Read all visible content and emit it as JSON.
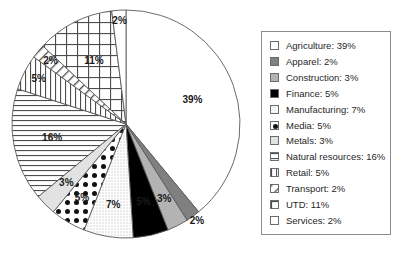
{
  "chart_data": {
    "type": "pie",
    "title": "",
    "subtitle": "",
    "xlabel": "",
    "ylabel": "",
    "grid": false,
    "legend_position": "right",
    "start_angle_deg": 0,
    "direction": "clockwise",
    "units": "percent",
    "categories": [
      "Agriculture",
      "Apparel",
      "Construction",
      "Finance",
      "Manufacturing",
      "Media",
      "Metals",
      "Natural resources",
      "Retail",
      "Transport",
      "UTD",
      "Services"
    ],
    "values": [
      39,
      2,
      3,
      5,
      7,
      5,
      3,
      16,
      5,
      2,
      11,
      2
    ],
    "slice_labels": [
      "39%",
      "2%",
      "3%",
      "5%",
      "7%",
      "5%",
      "3%",
      "16%",
      "5%",
      "2%",
      "11%",
      "2%"
    ],
    "fills": [
      "white",
      "dark-gray",
      "medium-gray",
      "black",
      "fine-dots",
      "polka-dots",
      "light-gray",
      "horizontal-lines",
      "vertical-lines",
      "diagonal-lines",
      "grid-crosshatch",
      "white"
    ],
    "colors": {
      "white": "#ffffff",
      "dark-gray": "#808080",
      "medium-gray": "#b3b3b3",
      "black": "#000000",
      "light-gray": "#e2e2e2",
      "outline": "#595959",
      "label_text": "#1a1a1a"
    }
  },
  "legend": {
    "items": [
      {
        "label": "Agriculture: 39%",
        "swatch": "white",
        "name": "legend-swatch-agriculture"
      },
      {
        "label": "Apparel: 2%",
        "swatch": "dark-gray",
        "name": "legend-swatch-apparel"
      },
      {
        "label": "Construction: 3%",
        "swatch": "medium-gray",
        "name": "legend-swatch-construction"
      },
      {
        "label": "Finance: 5%",
        "swatch": "black",
        "name": "legend-swatch-finance"
      },
      {
        "label": "Manufacturing: 7%",
        "swatch": "fine-dots",
        "name": "legend-swatch-manufacturing"
      },
      {
        "label": "Media: 5%",
        "swatch": "polka-dots",
        "name": "legend-swatch-media"
      },
      {
        "label": "Metals: 3%",
        "swatch": "light-gray",
        "name": "legend-swatch-metals"
      },
      {
        "label": "Natural resources: 16%",
        "swatch": "horizontal-lines",
        "name": "legend-swatch-natural-resources"
      },
      {
        "label": "Retail: 5%",
        "swatch": "vertical-lines",
        "name": "legend-swatch-retail"
      },
      {
        "label": "Transport: 2%",
        "swatch": "diagonal-lines",
        "name": "legend-swatch-transport"
      },
      {
        "label": "UTD: 11%",
        "swatch": "grid-crosshatch",
        "name": "legend-swatch-utd"
      },
      {
        "label": "Services: 2%",
        "swatch": "white",
        "name": "legend-swatch-services"
      }
    ]
  }
}
